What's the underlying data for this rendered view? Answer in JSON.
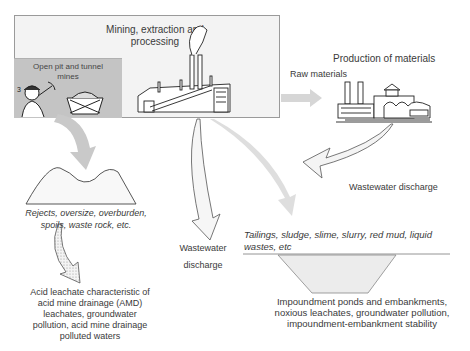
{
  "mining": {
    "title": "Mining, extraction and processing",
    "title_line1": "Mining, extraction and",
    "title_line2": "processing",
    "mines_label_line1": "Open pit  and tunnel",
    "mines_label_line2": "mines"
  },
  "raw_materials": {
    "label": "Raw materials"
  },
  "production": {
    "label": "Production of materials"
  },
  "wastewater_right": {
    "label": "Wastewater discharge"
  },
  "wastewater_center": {
    "line1": "Wastewater",
    "line2": "discharge"
  },
  "spoils": {
    "line1": "Rejects, oversize, overburden,",
    "line2": "spoils, waste rock, etc."
  },
  "acid": {
    "line1": "Acid leachate characteristic of",
    "line2": "acid mine drainage (AMD)",
    "line3": "leachates, groundwater",
    "line4": "pollution, acid mine drainage",
    "line5": "polluted waters"
  },
  "tailings": {
    "line1": "Tailings, sludge, slime, slurry, red mud,  liquid",
    "line2": "wastes, etc"
  },
  "impoundment": {
    "line1": "Impoundment ponds and embankments,",
    "line2": "noxious leachates, groundwater pollution,",
    "line3": "impoundment-embankment stability"
  },
  "colors": {
    "box_fill": "#f3f3f3",
    "mines_fill": "#c4c4c4",
    "arrow_gray": "#c8c8c8",
    "outline": "#666666"
  }
}
